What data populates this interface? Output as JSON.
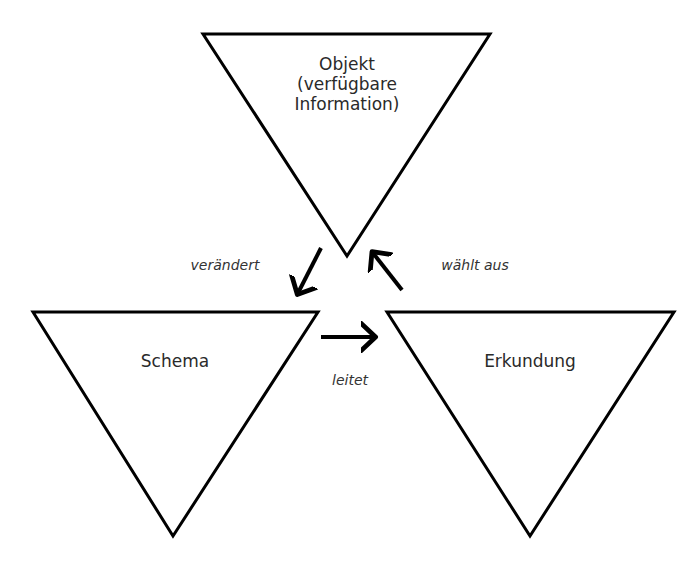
{
  "diagram": {
    "nodes": [
      {
        "id": "objekt",
        "lines": [
          "Objekt",
          "(verfügbare",
          "Information)"
        ]
      },
      {
        "id": "schema",
        "label": "Schema"
      },
      {
        "id": "erkundung",
        "label": "Erkundung"
      }
    ],
    "edges": [
      {
        "from": "objekt",
        "to": "schema",
        "label": "verändert"
      },
      {
        "from": "erkundung",
        "to": "objekt",
        "label": "wählt aus"
      },
      {
        "from": "schema",
        "to": "erkundung",
        "label": "leitet"
      }
    ],
    "colors": {
      "stroke": "#000000",
      "text": "#2a2a2a",
      "background": "#ffffff"
    }
  }
}
